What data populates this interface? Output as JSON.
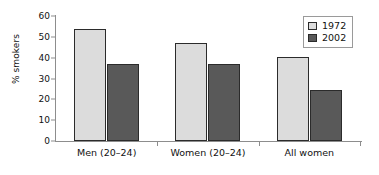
{
  "chart_data": {
    "type": "bar",
    "title": "",
    "xlabel": "",
    "ylabel": "% smokers",
    "ylim": [
      0,
      60
    ],
    "ytick_values": [
      0,
      10,
      20,
      30,
      40,
      50,
      60
    ],
    "ytick_labels": [
      "0",
      "10",
      "20",
      "30",
      "40",
      "50",
      "60"
    ],
    "grid": false,
    "legend_position": "top-right",
    "categories": [
      "Men (20–24)",
      "Women (20–24)",
      "All women"
    ],
    "series": [
      {
        "name": "1972",
        "color": "#dcdcdc",
        "values": [
          54,
          47,
          40.5
        ]
      },
      {
        "name": "2002",
        "color": "#595959",
        "values": [
          37,
          37,
          24.5
        ]
      }
    ]
  },
  "legend": {
    "entries": [
      {
        "label": "1972"
      },
      {
        "label": "2002"
      }
    ]
  },
  "colors": {
    "series_1972": "#dcdcdc",
    "series_2002": "#595959",
    "bar_outline": "#2b2b2b",
    "axis": "#8d8d8d",
    "text": "#111111",
    "background": "#ffffff"
  }
}
